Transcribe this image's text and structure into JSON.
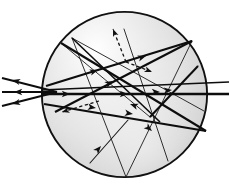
{
  "figure": {
    "title": "Ray tracing in a shaded spherical particle",
    "type": "optical-ray-diagram",
    "background_color": "#ffffff",
    "line_color": "#0f0f0f",
    "sphere": {
      "name": "shaded-sphere",
      "center_x": 124.5,
      "center_y": 94.5,
      "radius": 83.5,
      "outline_color": "#111111",
      "outline_width": 1.9,
      "fill_light": "#fdfdfd",
      "fill_mid": "#dedede",
      "fill_dark": "#b4b4b4",
      "highlight_x": 95,
      "highlight_y": 45
    },
    "incident_rays": {
      "name": "incident-beam",
      "count": 3,
      "entry_x": 57,
      "entry_y": 92,
      "tail_x": 2,
      "stroke_width": 1.9,
      "arrow_direction": "left",
      "tails_y": [
        78,
        92,
        106
      ]
    },
    "thick_rays": [
      {
        "id": "r1",
        "x1": 2,
        "y1": 78,
        "x2": 57,
        "y2": 92,
        "w": 1.9,
        "arrow": "start"
      },
      {
        "id": "r2",
        "x1": 2,
        "y1": 92,
        "x2": 57,
        "y2": 92,
        "w": 2.1,
        "arrow": "start"
      },
      {
        "id": "r3",
        "x1": 2,
        "y1": 106,
        "x2": 57,
        "y2": 92,
        "w": 1.9,
        "arrow": "start"
      },
      {
        "id": "r4",
        "x1": 41,
        "y1": 94,
        "x2": 229,
        "y2": 94,
        "w": 2.4,
        "arrow": "mid-right"
      },
      {
        "id": "r5",
        "x1": 41,
        "y1": 90,
        "x2": 229,
        "y2": 82,
        "w": 1.7,
        "arrow": "mid-right"
      },
      {
        "id": "r6",
        "x1": 44,
        "y1": 104,
        "x2": 206,
        "y2": 131,
        "w": 2.1,
        "arrow": "mid-right"
      },
      {
        "id": "r7",
        "x1": 46,
        "y1": 86,
        "x2": 192,
        "y2": 41,
        "w": 2.2,
        "arrow": "mid-right"
      },
      {
        "id": "r8",
        "x1": 61,
        "y1": 43,
        "x2": 206,
        "y2": 131,
        "w": 2.1,
        "arrow": "mid-right"
      },
      {
        "id": "r9",
        "x1": 192,
        "y1": 41,
        "x2": 55,
        "y2": 112,
        "w": 2.1,
        "arrow": "mid-left"
      },
      {
        "id": "r10",
        "x1": 150,
        "y1": 117,
        "x2": 198,
        "y2": 66,
        "w": 2.0,
        "arrow": "none"
      },
      {
        "id": "r11",
        "x1": 72,
        "y1": 38,
        "x2": 160,
        "y2": 122,
        "w": 1.6,
        "arrow": "mid-right"
      }
    ],
    "thin_rays": [
      {
        "id": "t1",
        "x1": 72,
        "y1": 38,
        "x2": 204,
        "y2": 111,
        "w": 0.9
      },
      {
        "id": "t2",
        "x1": 72,
        "y1": 38,
        "x2": 126,
        "y2": 177,
        "w": 0.9
      },
      {
        "id": "t3",
        "x1": 192,
        "y1": 41,
        "x2": 126,
        "y2": 177,
        "w": 0.9
      },
      {
        "id": "t4",
        "x1": 168,
        "y1": 161,
        "x2": 124,
        "y2": 29,
        "w": 0.9
      },
      {
        "id": "t5",
        "x1": 61,
        "y1": 43,
        "x2": 150,
        "y2": 117,
        "w": 0.9
      },
      {
        "id": "t6",
        "x1": 150,
        "y1": 117,
        "x2": 198,
        "y2": 66,
        "w": 0.9
      },
      {
        "id": "t7",
        "x1": 90,
        "y1": 163,
        "x2": 128,
        "y2": 120,
        "w": 1.1
      }
    ],
    "dashed_arrows": [
      {
        "id": "d1",
        "x1": 126,
        "y1": 62,
        "x2": 113,
        "y2": 29,
        "label": "scatter-up-left"
      },
      {
        "id": "d2",
        "x1": 126,
        "y1": 62,
        "x2": 152,
        "y2": 72,
        "label": "scatter-down-right"
      },
      {
        "id": "d3",
        "x1": 99,
        "y1": 101,
        "x2": 62,
        "y2": 112,
        "label": "scatter-left-down"
      }
    ],
    "arrow_markers": [
      {
        "id": "a1",
        "x": 12,
        "y": 80,
        "angle": 194
      },
      {
        "id": "a2",
        "x": 14,
        "y": 92,
        "angle": 180
      },
      {
        "id": "a3",
        "x": 12,
        "y": 104,
        "angle": 166
      },
      {
        "id": "a4",
        "x": 70,
        "y": 94,
        "angle": 0
      },
      {
        "id": "a5",
        "x": 128,
        "y": 94,
        "angle": 0
      },
      {
        "id": "a6",
        "x": 160,
        "y": 92,
        "angle": 0
      },
      {
        "id": "a7",
        "x": 96,
        "y": 108,
        "angle": 9
      },
      {
        "id": "a8",
        "x": 133,
        "y": 114,
        "angle": 9
      },
      {
        "id": "a9",
        "x": 98,
        "y": 70,
        "angle": 342
      },
      {
        "id": "a10",
        "x": 146,
        "y": 56,
        "angle": 342
      },
      {
        "id": "a11",
        "x": 113,
        "y": 81,
        "angle": 332
      },
      {
        "id": "a12",
        "x": 101,
        "y": 146,
        "angle": 311
      },
      {
        "id": "a13",
        "x": 152,
        "y": 131,
        "angle": 40
      },
      {
        "id": "a14",
        "x": 130,
        "y": 104,
        "angle": 200
      },
      {
        "id": "a15",
        "x": 172,
        "y": 90,
        "angle": 356
      }
    ]
  }
}
